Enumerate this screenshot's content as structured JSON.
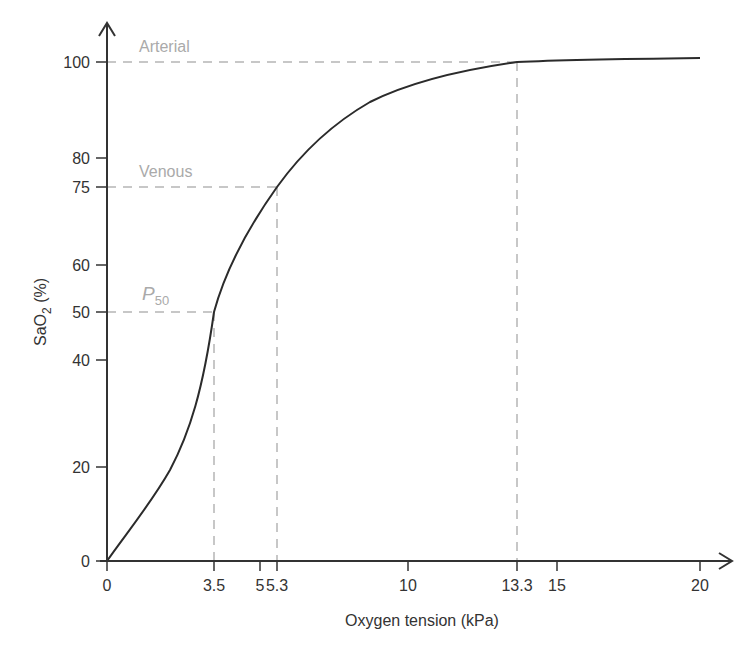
{
  "chart_data": {
    "type": "line",
    "title": "",
    "xlabel": "Oxygen tension (kPa)",
    "ylabel_main": "SaO",
    "ylabel_sub": "2",
    "ylabel_suffix": " (%)",
    "xlim": [
      0,
      20
    ],
    "ylim": [
      0,
      100
    ],
    "grid": false,
    "legend": "none",
    "x_ticks": [
      {
        "value": 0,
        "label": "0",
        "px": 107
      },
      {
        "value": 3.5,
        "label": "3.5",
        "px": 214
      },
      {
        "value": 5,
        "label": "5",
        "px": 260
      },
      {
        "value": 5.3,
        "label": "5.3",
        "px": 277
      },
      {
        "value": 10,
        "label": "10",
        "px": 408
      },
      {
        "value": 13.3,
        "label": "13.3",
        "px": 517
      },
      {
        "value": 15,
        "label": "15",
        "px": 557
      },
      {
        "value": 20,
        "label": "20",
        "px": 700
      }
    ],
    "y_ticks": [
      {
        "value": 0,
        "label": "0",
        "px": 561
      },
      {
        "value": 20,
        "label": "20",
        "px": 467
      },
      {
        "value": 40,
        "label": "40",
        "px": 360
      },
      {
        "value": 50,
        "label": "50",
        "px": 312
      },
      {
        "value": 60,
        "label": "60",
        "px": 265
      },
      {
        "value": 75,
        "label": "75",
        "px": 187
      },
      {
        "value": 80,
        "label": "80",
        "px": 158
      },
      {
        "value": 100,
        "label": "100",
        "px": 62
      }
    ],
    "series": [
      {
        "name": "Oxyhaemoglobin dissociation curve",
        "x": [
          0,
          1,
          2,
          3,
          3.5,
          4,
          5,
          5.3,
          6,
          7,
          8,
          9,
          10,
          11,
          12,
          13.3,
          15,
          17,
          20
        ],
        "y": [
          0,
          10,
          23,
          40,
          50,
          58,
          71,
          75,
          80,
          86,
          90,
          93,
          95,
          97,
          98.5,
          100,
          100.5,
          100.8,
          101
        ]
      }
    ],
    "annotations": [
      {
        "label": "Arterial",
        "x": 13.3,
        "y": 100
      },
      {
        "label": "Venous",
        "x": 5.3,
        "y": 75
      },
      {
        "label_main": "P",
        "label_sub": "50",
        "x": 3.5,
        "y": 50
      }
    ],
    "colors": {
      "curve": "#2b2b2b",
      "axis": "#333333",
      "guide": "#b5b5b5",
      "annotation": "#aaaaaa"
    }
  },
  "curve_path": "M107,561 C125,535 150,505 170,470 C190,432 203,390 214,312 C226,268 250,225 277,187 C300,155 330,125 370,102 C410,82 460,70 517,62 C560,60 620,59 700,58"
}
